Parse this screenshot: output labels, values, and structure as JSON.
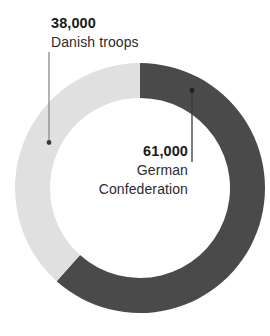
{
  "chart_data": {
    "type": "pie",
    "variant": "donut",
    "title": "",
    "subtitle": "",
    "xlabel": "",
    "ylabel": "",
    "legend_position": "none",
    "grid": false,
    "total": 99000,
    "units": "troops",
    "categories": [
      "German Confederation",
      "Danish troops"
    ],
    "values": [
      61000,
      38000
    ],
    "value_labels": [
      "61,000",
      "38,000"
    ],
    "percentages": [
      61.6,
      38.4
    ],
    "colors": [
      "#4a4a4a",
      "#e0e0e0"
    ],
    "slices": [
      {
        "name": "German Confederation",
        "value": 61000,
        "value_label": "61,000",
        "percent": 61.6,
        "start_angle_deg": 0,
        "end_angle_deg": 222,
        "color": "#4a4a4a",
        "callout_color": "#3a3a3a"
      },
      {
        "name": "Danish troops",
        "value": 38000,
        "value_label": "38,000",
        "percent": 38.4,
        "start_angle_deg": 222,
        "end_angle_deg": 360,
        "color": "#e0e0e0",
        "callout_color": "#8a8a8a"
      }
    ]
  },
  "callouts": {
    "danish": {
      "value": "38,000",
      "name": "Danish troops"
    },
    "german": {
      "value": "61,000",
      "name_line1": "German",
      "name_line2": "Confederation"
    }
  },
  "geometry": {
    "center_x": 140,
    "center_y": 188,
    "outer_radius": 125,
    "inner_radius": 90
  },
  "colors": {
    "background": "#ffffff",
    "dark_slice": "#4a4a4a",
    "light_slice": "#e0e0e0",
    "text": "#1a1a1a",
    "leader_dark": "#3a3a3a",
    "leader_light": "#8a8a8a"
  }
}
